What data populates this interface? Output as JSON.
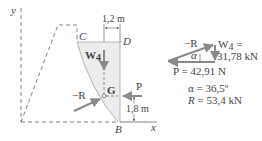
{
  "diagram": {
    "axes": {
      "y_label": "y",
      "x_label": "x"
    },
    "points": {
      "C": "C",
      "D": "D",
      "B": "B",
      "G": "G"
    },
    "dimensions": {
      "horizontal": "1,2 m",
      "vertical": "1,8 m"
    },
    "forces": {
      "weight": "W",
      "weight_sub": "4",
      "pressure": "P",
      "reaction": "−R"
    },
    "force_triangle": {
      "reaction_label": "−R",
      "angle_label": "α",
      "weight_label": "W",
      "weight_sub": "4",
      "weight_eq": "=",
      "weight_value": "31,78 kN",
      "pressure_value": "P = 42,91 N"
    },
    "results": {
      "alpha": "α = 36,5º",
      "R_symbol": "R",
      "R_value": " = 53,4 kN"
    },
    "colors": {
      "line": "#555555",
      "dash": "#666666",
      "arrow": "#888888",
      "fill": "#eeeeee",
      "text": "#444444"
    }
  }
}
